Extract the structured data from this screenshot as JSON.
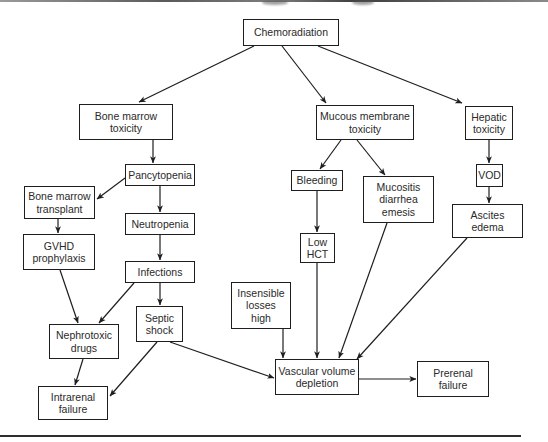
{
  "diagram": {
    "type": "flowchart",
    "colors": {
      "line": "#1e1e1e",
      "box_fill": "#ffffff",
      "text": "#2a2a2a"
    },
    "nodes": {
      "chemoradiation": "Chemoradiation",
      "bone_marrow_toxicity": "Bone marrow\ntoxicity",
      "mucous_membrane_toxicity": "Mucous membrane\ntoxicity",
      "hepatic_toxicity": "Hepatic\ntoxicity",
      "pancytopenia": "Pancytopenia",
      "bone_marrow_transplant": "Bone marrow\ntransplant",
      "neutropenia": "Neutropenia",
      "gvhd_prophylaxis": "GVHD\nprophylaxis",
      "infections": "Infections",
      "septic_shock": "Septic\nshock",
      "nephrotoxic_drugs": "Nephrotoxic\ndrugs",
      "intrarenal_failure": "Intrarenal\nfailure",
      "bleeding": "Bleeding",
      "low_hct": "Low\nHCT",
      "mucositis": "Mucositis\ndiarrhea\nemesis",
      "vod": "VOD",
      "ascites_edema": "Ascites\nedema",
      "insensible_losses": "Insensible\nlosses\nhigh",
      "vascular_volume_depletion": "Vascular volume\ndepletion",
      "prerenal_failure": "Prerenal\nfailure"
    },
    "edges": [
      {
        "from": "Chemoradiation",
        "to": "Bone marrow toxicity"
      },
      {
        "from": "Chemoradiation",
        "to": "Mucous membrane toxicity"
      },
      {
        "from": "Chemoradiation",
        "to": "Hepatic toxicity"
      },
      {
        "from": "Bone marrow toxicity",
        "to": "Pancytopenia"
      },
      {
        "from": "Pancytopenia",
        "to": "Bone marrow transplant"
      },
      {
        "from": "Pancytopenia",
        "to": "Neutropenia"
      },
      {
        "from": "Bone marrow transplant",
        "to": "GVHD prophylaxis"
      },
      {
        "from": "Neutropenia",
        "to": "Infections"
      },
      {
        "from": "GVHD prophylaxis",
        "to": "Nephrotoxic drugs"
      },
      {
        "from": "Infections",
        "to": "Nephrotoxic drugs"
      },
      {
        "from": "Infections",
        "to": "Septic shock"
      },
      {
        "from": "Nephrotoxic drugs",
        "to": "Intrarenal failure"
      },
      {
        "from": "Septic shock",
        "to": "Intrarenal failure"
      },
      {
        "from": "Septic shock",
        "to": "Vascular volume depletion"
      },
      {
        "from": "Mucous membrane toxicity",
        "to": "Bleeding"
      },
      {
        "from": "Mucous membrane toxicity",
        "to": "Mucositis diarrhea emesis"
      },
      {
        "from": "Bleeding",
        "to": "Low HCT"
      },
      {
        "from": "Low HCT",
        "to": "Vascular volume depletion"
      },
      {
        "from": "Mucositis diarrhea emesis",
        "to": "Vascular volume depletion"
      },
      {
        "from": "Hepatic toxicity",
        "to": "VOD"
      },
      {
        "from": "VOD",
        "to": "Ascites edema"
      },
      {
        "from": "Ascites edema",
        "to": "Vascular volume depletion"
      },
      {
        "from": "Insensible losses high",
        "to": "Vascular volume depletion"
      },
      {
        "from": "Vascular volume depletion",
        "to": "Prerenal failure"
      }
    ]
  }
}
